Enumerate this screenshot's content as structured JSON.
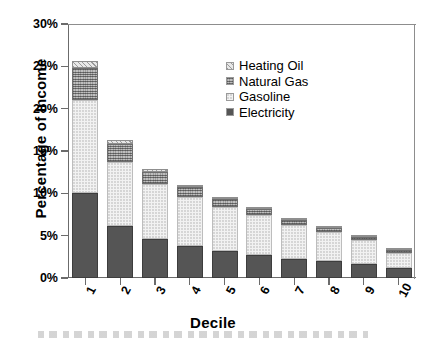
{
  "chart_data": {
    "type": "bar",
    "title": "",
    "subtitle": "",
    "stacked": true,
    "xlabel": "Decile",
    "ylabel": "Percentage of  Income",
    "categories": [
      "1",
      "2",
      "3",
      "4",
      "5",
      "6",
      "7",
      "8",
      "9",
      "10"
    ],
    "ylim": [
      0,
      30
    ],
    "ytick_values": [
      0,
      5,
      10,
      15,
      20,
      25,
      30
    ],
    "ytick_labels": [
      "0%",
      "5%",
      "10%",
      "15%",
      "20%",
      "25%",
      "30%"
    ],
    "grid": false,
    "legend_position": "upper-center-right",
    "series": [
      {
        "name": "Electricity",
        "pattern": "solid-dark",
        "color": "#555555",
        "values": [
          10.0,
          6.1,
          4.6,
          3.8,
          3.2,
          2.7,
          2.3,
          2.0,
          1.6,
          1.2
        ]
      },
      {
        "name": "Gasoline",
        "pattern": "light-dotted",
        "color": "#f2f2f2",
        "values": [
          11.0,
          7.6,
          6.5,
          5.8,
          5.2,
          4.7,
          4.0,
          3.4,
          2.9,
          1.8
        ]
      },
      {
        "name": "Natural Gas",
        "pattern": "dark-crosshatch",
        "color": "#9a9a9a",
        "values": [
          3.8,
          2.1,
          1.4,
          1.1,
          0.9,
          0.8,
          0.6,
          0.5,
          0.4,
          0.3
        ]
      },
      {
        "name": "Heating Oil",
        "pattern": "diagonal-hatch",
        "color": "#e8e8e8",
        "values": [
          0.8,
          0.5,
          0.4,
          0.3,
          0.3,
          0.2,
          0.2,
          0.2,
          0.2,
          0.2
        ]
      }
    ],
    "totals": [
      25.6,
      16.3,
      12.9,
      11.0,
      9.6,
      8.4,
      7.1,
      6.1,
      5.1,
      3.5
    ]
  },
  "axes": {
    "y_title": "Percentage of  Income",
    "x_title": "Decile"
  },
  "legend": {
    "entries": [
      {
        "label": "Heating Oil",
        "swatch": "heatingoil"
      },
      {
        "label": "Natural Gas",
        "swatch": "naturalgas"
      },
      {
        "label": "Gasoline",
        "swatch": "gasoline"
      },
      {
        "label": "Electricity",
        "swatch": "electricity"
      }
    ]
  }
}
